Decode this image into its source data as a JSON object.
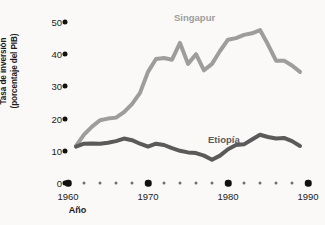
{
  "chart_data": {
    "type": "line",
    "title": "",
    "xlabel": "Año",
    "ylabel": "Tasa de inversión\n(porcentaje del PIB)",
    "xlim": [
      1960,
      1990
    ],
    "ylim": [
      0,
      52
    ],
    "grid": false,
    "legend_position": "inline-labels",
    "x_tick_labels": [
      "1960",
      "1970",
      "1980",
      "1990"
    ],
    "x_major_ticks": [
      1960,
      1970,
      1980,
      1990
    ],
    "x_minor_ticks": [
      1962,
      1964,
      1966,
      1968,
      1972,
      1974,
      1976,
      1978,
      1982,
      1984,
      1986,
      1988
    ],
    "y_tick_labels": [
      "50",
      "40",
      "30",
      "20",
      "10",
      "0"
    ],
    "y_ticks": [
      50,
      40,
      30,
      20,
      10,
      0
    ],
    "x": [
      1961,
      1962,
      1963,
      1964,
      1965,
      1966,
      1967,
      1968,
      1969,
      1970,
      1971,
      1972,
      1973,
      1974,
      1975,
      1976,
      1977,
      1978,
      1979,
      1980,
      1981,
      1982,
      1983,
      1984,
      1985,
      1986,
      1987,
      1988,
      1989
    ],
    "series": [
      {
        "name": "Singapur",
        "color": "#9d9d9d",
        "values": [
          11.5,
          15.0,
          17.5,
          19.5,
          20.0,
          20.3,
          22.0,
          24.5,
          28.0,
          34.5,
          38.5,
          38.8,
          38.3,
          43.5,
          37.0,
          40.0,
          35.0,
          37.0,
          41.0,
          44.5,
          45.0,
          46.0,
          46.5,
          47.5,
          43.0,
          38.0,
          38.0,
          36.5,
          34.5
        ]
      },
      {
        "name": "Etiopía",
        "color": "#5a5a5a",
        "values": [
          11.3,
          12.2,
          12.3,
          12.2,
          12.5,
          13.0,
          13.8,
          13.3,
          12.2,
          11.3,
          12.2,
          11.8,
          10.8,
          10.0,
          9.5,
          9.3,
          8.5,
          7.2,
          8.5,
          10.5,
          11.8,
          12.0,
          13.5,
          15.0,
          14.3,
          13.8,
          14.0,
          13.0,
          11.5
        ]
      }
    ]
  },
  "labels": {
    "y_axis_title": "Tasa de inversión\n(porcentaje del PIB)",
    "x_axis_title": "Año",
    "singapur": "Singapur",
    "etiopia": "Etiopía"
  }
}
